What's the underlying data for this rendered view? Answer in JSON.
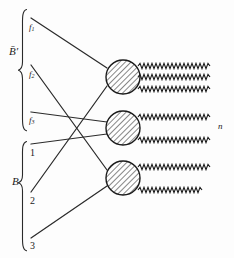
{
  "figure": {
    "kind": "process-interaction-diagram",
    "background_color": "#fdfdfd",
    "ink_color": "#1b1b1b",
    "width": 234,
    "height": 258
  },
  "groups": [
    {
      "id": "upper",
      "label": "B̄′",
      "label_plain": "B-bar prime",
      "brace_top": 9,
      "brace_bottom": 131,
      "label_x": 12,
      "label_y": 52
    },
    {
      "id": "lower",
      "label": "B",
      "label_plain": "B",
      "brace_top": 141,
      "brace_bottom": 251,
      "label_x": 14,
      "label_y": 182
    }
  ],
  "inputs": [
    {
      "id": "f1",
      "base": "f",
      "sub": "1",
      "kind": "italic-sub",
      "x": 30,
      "y": 30,
      "node_x": 36,
      "node_y": 22
    },
    {
      "id": "f2",
      "base": "f",
      "sub": "2",
      "kind": "italic-sub",
      "x": 30,
      "y": 77,
      "node_x": 36,
      "node_y": 68
    },
    {
      "id": "f3",
      "base": "f",
      "sub": "3",
      "kind": "italic-sub",
      "x": 30,
      "y": 123,
      "node_x": 36,
      "node_y": 115
    },
    {
      "id": "b1",
      "base": "1",
      "sub": "",
      "kind": "plain",
      "x": 31,
      "y": 156,
      "node_x": 36,
      "node_y": 146
    },
    {
      "id": "b2",
      "base": "2",
      "sub": "",
      "kind": "plain",
      "x": 31,
      "y": 204,
      "node_x": 36,
      "node_y": 194
    },
    {
      "id": "b3",
      "base": "3",
      "sub": "",
      "kind": "plain",
      "x": 31,
      "y": 249,
      "node_x": 36,
      "node_y": 240
    }
  ],
  "vertices": [
    {
      "id": "v-top",
      "cx": 123,
      "cy": 77,
      "r": 17,
      "fill": "hatch-45",
      "outputs": 3
    },
    {
      "id": "v-middle",
      "cx": 123,
      "cy": 128,
      "r": 17,
      "fill": "hatch-45",
      "outputs": 2
    },
    {
      "id": "v-bottom",
      "cx": 123,
      "cy": 178,
      "r": 17,
      "fill": "hatch-45",
      "outputs": 2
    }
  ],
  "edges": [
    {
      "from": "f1",
      "to": "v-top",
      "style": "straight"
    },
    {
      "from": "f2",
      "to": "v-bottom",
      "style": "straight"
    },
    {
      "from": "f3",
      "to": "v-middle",
      "style": "straight"
    },
    {
      "from": "b1",
      "to": "v-middle",
      "style": "straight"
    },
    {
      "from": "b2",
      "to": "v-top",
      "style": "straight"
    },
    {
      "from": "b3",
      "to": "v-bottom",
      "style": "straight"
    }
  ],
  "outputs": {
    "style": "zigzag-wave",
    "x_start": 140,
    "x_end": 212,
    "label": "n",
    "label_x": 219,
    "label_y": 128,
    "lines": [
      {
        "id": "out-1",
        "y": 66,
        "vertex": "v-top"
      },
      {
        "id": "out-2",
        "y": 77,
        "vertex": "v-top"
      },
      {
        "id": "out-3",
        "y": 89,
        "vertex": "v-top"
      },
      {
        "id": "out-4",
        "y": 117,
        "vertex": "v-middle"
      },
      {
        "id": "out-5",
        "y": 140,
        "vertex": "v-middle"
      },
      {
        "id": "out-6",
        "y": 167,
        "vertex": "v-bottom"
      },
      {
        "id": "out-7",
        "y": 190,
        "vertex": "v-bottom"
      }
    ]
  }
}
